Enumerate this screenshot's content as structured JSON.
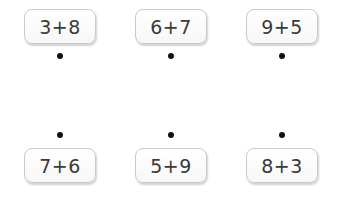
{
  "top_row": [
    {
      "expr": "3+8",
      "x": 24,
      "y": 9
    },
    {
      "expr": "6+7",
      "x": 135,
      "y": 9
    },
    {
      "expr": "9+5",
      "x": 246,
      "y": 9
    }
  ],
  "bottom_row": [
    {
      "expr": "7+6",
      "x": 24,
      "y": 148
    },
    {
      "expr": "5+9",
      "x": 135,
      "y": 148
    },
    {
      "expr": "8+3",
      "x": 246,
      "y": 148
    }
  ],
  "top_dots": [
    {
      "x": 57,
      "y": 53
    },
    {
      "x": 168,
      "y": 53
    },
    {
      "x": 279,
      "y": 53
    }
  ],
  "bottom_dots": [
    {
      "x": 57,
      "y": 132
    },
    {
      "x": 168,
      "y": 132
    },
    {
      "x": 279,
      "y": 132
    }
  ]
}
